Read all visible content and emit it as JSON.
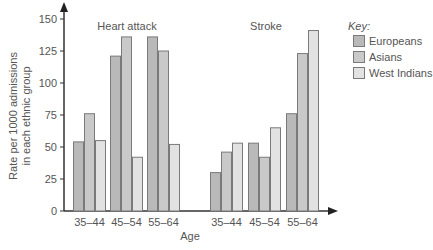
{
  "chart_data": {
    "type": "bar",
    "title": "",
    "xlabel": "Age",
    "ylabel": "Rate per 1000 admissions in each ethnic group",
    "ylabel_lines": [
      "Rate per 1000 admissions",
      "in each ethnic group"
    ],
    "ylim": [
      0,
      150
    ],
    "yticks": [
      0,
      25,
      50,
      75,
      100,
      125,
      150
    ],
    "grid": false,
    "legend_position": "right",
    "legend_title": "Key:",
    "panels": [
      {
        "title": "Heart attack",
        "categories": [
          "35–44",
          "45–54",
          "55–64"
        ],
        "series": [
          {
            "name": "Europeans",
            "values": [
              54,
              121,
              136
            ]
          },
          {
            "name": "Asians",
            "values": [
              76,
              136,
              125
            ]
          },
          {
            "name": "West Indians",
            "values": [
              55,
              42,
              52
            ]
          }
        ]
      },
      {
        "title": "Stroke",
        "categories": [
          "35–44",
          "45–54",
          "55–64"
        ],
        "series": [
          {
            "name": "Europeans",
            "values": [
              30,
              53,
              76
            ]
          },
          {
            "name": "Asians",
            "values": [
              46,
              42,
              123
            ]
          },
          {
            "name": "West Indians",
            "values": [
              53,
              65,
              141
            ]
          }
        ]
      }
    ],
    "series_colors": {
      "Europeans": "#b9b9b9",
      "Asians": "#c9c9c9",
      "West Indians": "#e2e2e2"
    },
    "border_color": "#7a7a7a"
  }
}
